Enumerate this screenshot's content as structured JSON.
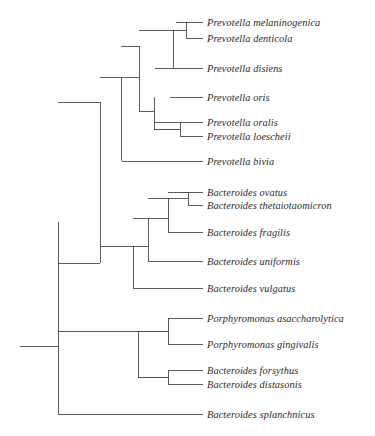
{
  "figure": {
    "type": "phylogenetic-cladogram",
    "title": "",
    "background_color": "#ffffff",
    "line_color": "#4a4a4a",
    "text_color": "#2b2b2b"
  },
  "taxa": [
    {
      "name": "Prevotella melaninogenica",
      "y": 22,
      "tip_x": 176
    },
    {
      "name": "Prevotella denticola",
      "y": 38,
      "tip_x": 186
    },
    {
      "name": "Prevotella disiens",
      "y": 68,
      "tip_x": 155
    },
    {
      "name": "Prevotella oris",
      "y": 97,
      "tip_x": 170
    },
    {
      "name": "Prevotella oralis",
      "y": 122,
      "tip_x": 155
    },
    {
      "name": "Prevotella loescheii",
      "y": 136,
      "tip_x": 180
    },
    {
      "name": "Prevotella bivia",
      "y": 161,
      "tip_x": 122
    },
    {
      "name": "Bacteroides ovatus",
      "y": 192,
      "tip_x": 180
    },
    {
      "name": "Bacteroides thetaiotaomicron",
      "y": 205,
      "tip_x": 188
    },
    {
      "name": "Bacteroides fragilis",
      "y": 232,
      "tip_x": 168
    },
    {
      "name": "Bacteroides uniformis",
      "y": 261,
      "tip_x": 148
    },
    {
      "name": "Bacteroides vulgatus",
      "y": 288,
      "tip_x": 133
    },
    {
      "name": "Porphyromonas asaccharolytica",
      "y": 318,
      "tip_x": 168
    },
    {
      "name": "Porphyromonas gingivalis",
      "y": 344,
      "tip_x": 168
    },
    {
      "name": "Bacteroides forsythus",
      "y": 370,
      "tip_x": 168
    },
    {
      "name": "Bacteroides distasonis",
      "y": 384,
      "tip_x": 168
    },
    {
      "name": "Bacteroides splanchnicus",
      "y": 414,
      "tip_x": 58
    }
  ],
  "layout": {
    "label_x": 207,
    "tip_end_x": 203,
    "root_stem_x_start": 20,
    "root_x": 58,
    "stroke_width": 0.9
  },
  "nodes": [
    {
      "id": "root",
      "x": 58,
      "y_top": 346,
      "y_bottom": 414
    },
    {
      "id": "main-clade",
      "x": 58,
      "y_top": 222,
      "y_bottom": 346
    },
    {
      "id": "prev-bact",
      "x": 100,
      "y_top": 102,
      "y_bottom": 263
    },
    {
      "id": "prevotella-all",
      "x": 121,
      "y_top": 77,
      "y_bottom": 161
    },
    {
      "id": "prevotella-core",
      "x": 139,
      "y_top": 46,
      "y_bottom": 111
    },
    {
      "id": "prev-mel-dis",
      "x": 173,
      "y_top": 30,
      "y_bottom": 68
    },
    {
      "id": "prev-mel-den",
      "x": 186,
      "y_top": 22,
      "y_bottom": 38
    },
    {
      "id": "prev-oris-grp",
      "x": 154,
      "y_top": 97,
      "y_bottom": 129
    },
    {
      "id": "prev-oral-loe",
      "x": 180,
      "y_top": 122,
      "y_bottom": 136
    },
    {
      "id": "bacteroides-all",
      "x": 133,
      "y_top": 246,
      "y_bottom": 288
    },
    {
      "id": "bact-core",
      "x": 148,
      "y_top": 218,
      "y_bottom": 261
    },
    {
      "id": "bact-ovt-fra",
      "x": 168,
      "y_top": 198,
      "y_bottom": 232
    },
    {
      "id": "bact-ovt-the",
      "x": 188,
      "y_top": 192,
      "y_bottom": 205
    },
    {
      "id": "porphy-clade",
      "x": 138,
      "y_top": 331,
      "y_bottom": 377
    },
    {
      "id": "porphy-pair",
      "x": 168,
      "y_top": 318,
      "y_bottom": 344
    },
    {
      "id": "bact-for-dis",
      "x": 168,
      "y_top": 370,
      "y_bottom": 384
    }
  ]
}
